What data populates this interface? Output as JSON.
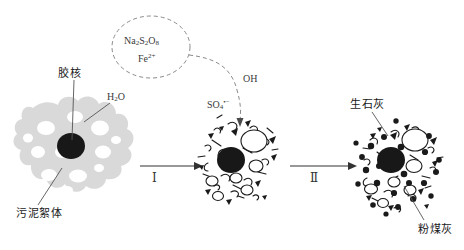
{
  "figure": {
    "type": "process-schematic",
    "background_color": "#ffffff",
    "ink_color": "#1a1a1a",
    "floc_gray": "#d9d9d9",
    "core_black": "#1a1a1a"
  },
  "reagent_bubble": {
    "name": "reagent-bubble",
    "style": "dashed-ellipse",
    "line1_html": "Na<sub>2</sub>S<sub>2</sub>O<sub>8</sub>",
    "line1_text": "Na2S2O8",
    "line2_html": "Fe<sup>2+</sup>",
    "line2_text": "Fe2+"
  },
  "labels": {
    "micelle_core": "胶核",
    "water": "H₂O",
    "water_html": "H<sub>2</sub>O",
    "sludge_floc": "污泥絮体",
    "sulfate_radical": "SO₄",
    "sulfate_radical_html": "SO<sub>4</sub><sup>•−</sup>",
    "hydroxyl_radical": "OH",
    "quicklime": "生石灰",
    "fly_ash": "粉煤灰"
  },
  "stages": [
    {
      "id": "stage-1",
      "name": "sludge-floc-stage",
      "annotations": [
        "胶核",
        "H₂O",
        "污泥絮体"
      ]
    },
    {
      "id": "stage-2",
      "name": "oxidized-floc-stage",
      "annotations": [
        "SO₄",
        "OH"
      ]
    },
    {
      "id": "stage-3",
      "name": "conditioned-floc-stage",
      "annotations": [
        "生石灰",
        "粉煤灰"
      ]
    }
  ],
  "arrows": [
    {
      "name": "arrow-step-1",
      "numeral": "Ⅰ",
      "from": "stage-1",
      "to": "stage-2"
    },
    {
      "name": "arrow-step-2",
      "numeral": "Ⅱ",
      "from": "stage-2",
      "to": "stage-3"
    },
    {
      "name": "dashed-reagent-arrow",
      "numeral": "",
      "from": "reagent-bubble",
      "to": "stage-2"
    }
  ]
}
